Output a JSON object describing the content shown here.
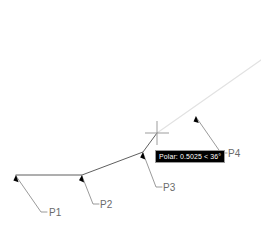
{
  "canvas": {
    "width": 261,
    "height": 232,
    "background_color": "#ffffff",
    "geometry_color": "#4d4d4d",
    "leader_color": "#808080",
    "tracking_color": "#e2e2e2",
    "crosshair_color": "#9d9d9d",
    "arrow_color": "#000000",
    "label_color": "#6b6b6b"
  },
  "tooltip": {
    "text": "Polar: 0.5025 < 36°",
    "background_color": "#000000",
    "text_color": "#ffffff",
    "border_color": "#9a9a9a",
    "x": 155,
    "y": 150
  },
  "crosshair": {
    "x": 157,
    "y": 133,
    "arm_length": 12
  },
  "polyline": {
    "points": "16,175 82,175 143,152 157,133"
  },
  "tracking_line": {
    "x1": 157,
    "y1": 133,
    "x2": 261,
    "y2": 60
  },
  "labels": [
    {
      "id": "P1",
      "text": "P1",
      "anchor_x": 16,
      "anchor_y": 175,
      "leader": "16,176 41,212 47,212",
      "text_x": 49,
      "text_y": 216,
      "arrow": "16,175 18.6,182.2 13.4,180.6"
    },
    {
      "id": "P2",
      "text": "P2",
      "anchor_x": 82,
      "anchor_y": 175,
      "leader": "82,176 93,204 99,204",
      "text_x": 100,
      "text_y": 208,
      "arrow": "82,175 84.1,182.6 79.0,180.2"
    },
    {
      "id": "P3",
      "text": "P3",
      "anchor_x": 143,
      "anchor_y": 152,
      "leader": "143,153 156,187 162,187",
      "text_x": 163,
      "text_y": 191,
      "arrow": "143,152 145.3,159.5 140.2,157.4"
    },
    {
      "id": "P4",
      "text": "P4",
      "anchor_x": 196,
      "anchor_y": 116,
      "leader": "196,117 221,153 227,153",
      "text_x": 228,
      "text_y": 157,
      "arrow": "196,116 198.8,123.1 193.5,121.6"
    }
  ]
}
